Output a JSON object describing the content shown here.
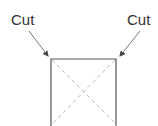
{
  "labels": {
    "left_cut": "Cut",
    "right_cut": "Cut"
  },
  "colors": {
    "stroke": "#555555",
    "dashed": "#bbbbbb",
    "text": "#333333"
  }
}
